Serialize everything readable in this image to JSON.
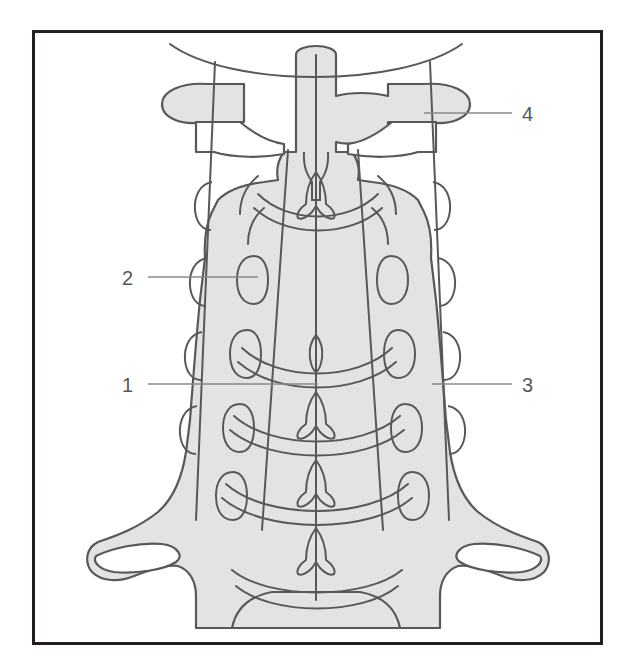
{
  "figure": {
    "kind": "anatomical-line-drawing",
    "frame": {
      "border_color": "#231f20",
      "border_width": 3,
      "x": 32,
      "y": 30,
      "width": 570,
      "height": 614
    },
    "palette": {
      "bone_fill": "#e3e3e3",
      "outline": "#58585a",
      "leader_line": "#8a8a8d",
      "label_text": "#58585a",
      "background": "#ffffff"
    }
  },
  "labels": [
    {
      "id": "label-1",
      "text": "1",
      "text_x": 133,
      "text_y": 392,
      "leader": {
        "x1": 148,
        "y1": 384,
        "x2": 318,
        "y2": 384
      },
      "anchor_side": "left",
      "points_to": "spinous-process-midline"
    },
    {
      "id": "label-2",
      "text": "2",
      "text_x": 133,
      "text_y": 285,
      "leader": {
        "x1": 148,
        "y1": 277,
        "x2": 258,
        "y2": 277
      },
      "anchor_side": "left",
      "points_to": "articular-pillar"
    },
    {
      "id": "label-3",
      "text": "3",
      "text_x": 522,
      "text_y": 392,
      "leader": {
        "x1": 432,
        "y1": 384,
        "x2": 512,
        "y2": 384
      },
      "anchor_side": "right",
      "points_to": "lateral-margin-uncinate-process"
    },
    {
      "id": "label-4",
      "text": "4",
      "text_x": 522,
      "text_y": 121,
      "leader": {
        "x1": 424,
        "y1": 113,
        "x2": 512,
        "y2": 113
      },
      "anchor_side": "right",
      "points_to": "transverse-process"
    }
  ],
  "vertical_lines": [
    {
      "name": "left-lateral-pillar-line",
      "x_top": 215,
      "y_top": 62,
      "x_bottom": 196,
      "y_bottom": 520
    },
    {
      "name": "midline-spinous-line",
      "x_top": 316,
      "y_top": 55,
      "x_bottom": 316,
      "y_bottom": 600
    },
    {
      "name": "right-lateral-pillar-line",
      "x_top": 430,
      "y_top": 62,
      "x_bottom": 449,
      "y_bottom": 520
    },
    {
      "name": "left-inner-facet-line",
      "x_top": 288,
      "y_top": 150,
      "x_bottom": 262,
      "y_bottom": 530
    },
    {
      "name": "right-inner-facet-line",
      "x_top": 358,
      "y_top": 150,
      "x_bottom": 383,
      "y_bottom": 530
    }
  ],
  "structures": [
    {
      "name": "skull-base-curve",
      "count": 1
    },
    {
      "name": "odontoid-dens",
      "count": 1
    },
    {
      "name": "transverse-process-left",
      "count": 1
    },
    {
      "name": "transverse-process-right",
      "count": 1
    },
    {
      "name": "spinous-process",
      "count": 5
    },
    {
      "name": "uncinate-process-left",
      "count": 5
    },
    {
      "name": "uncinate-process-right",
      "count": 5
    },
    {
      "name": "articular-pillar-left",
      "count": 4
    },
    {
      "name": "articular-pillar-right",
      "count": 4
    },
    {
      "name": "disc-space-curve",
      "count": 5
    },
    {
      "name": "first-rib-shadow",
      "count": 2
    }
  ]
}
